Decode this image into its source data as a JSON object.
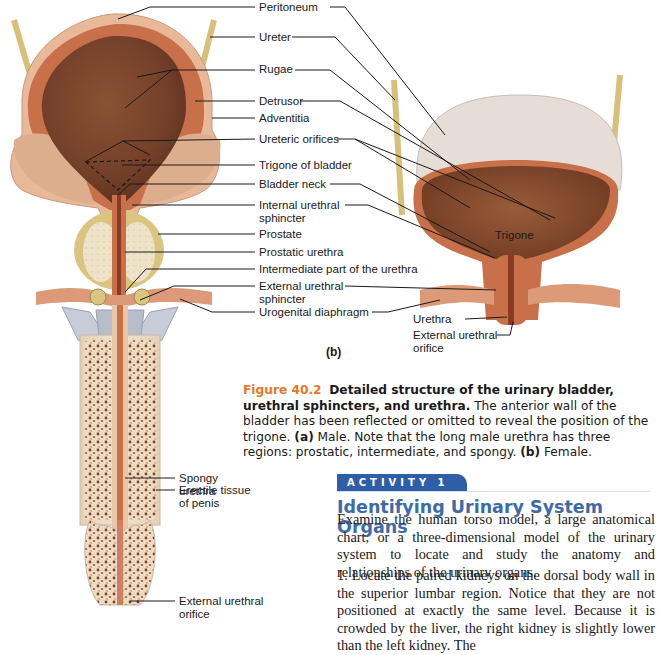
{
  "figure": {
    "panel_a_labels": {
      "peritoneum": "Peritoneum",
      "ureter": "Ureter",
      "rugae": "Rugae",
      "detrusor": "Detrusor",
      "adventitia": "Adventitia",
      "ureteric_orifices": "Ureteric orifices",
      "trigone_of_bladder": "Trigone of bladder",
      "bladder_neck": "Bladder neck",
      "internal_urethral_sphincter": "Internal urethral sphincter",
      "prostate": "Prostate",
      "prostatic_urethra": "Prostatic urethra",
      "intermediate_urethra": "Intermediate part of the urethra",
      "external_urethral_sphincter": "External urethral sphincter",
      "urogenital_diaphragm": "Urogenital diaphragm",
      "spongy_urethra": "Spongy urethra",
      "erectile_tissue": "Erectile tissue of penis",
      "external_urethral_orifice": "External urethral orifice"
    },
    "panel_b_labels": {
      "trigone": "Trigone",
      "urethra": "Urethra",
      "external_urethral_orifice": "External urethral orifice"
    },
    "panel_b_letter": "(b)",
    "colors": {
      "bladder_interior": "#7a4328",
      "bladder_wall": "#c8704a",
      "peritoneum": "#e8c6a8",
      "ureter": "#d8c07a",
      "prostate": "#d9c480",
      "erectile_tissue": "#ead8c0",
      "leader_line": "#1a1a1a"
    }
  },
  "caption": {
    "figure_number": "Figure 40.2",
    "title": "Detailed structure of the urinary bladder, urethral sphincters, and urethra.",
    "text1": " The anterior wall of the bladder has been reflected or omitted to reveal the position of the trigone. ",
    "a_label": "(a)",
    "text2": " Male. Note that the long male urethra has three regions: prostatic, intermediate, and spongy. ",
    "b_label": "(b)",
    "text3": " Female.",
    "figure_color": "#e37a2a"
  },
  "activity": {
    "badge": "ACTIVITY 1",
    "badge_color": "#2f5ea8",
    "title": "Identifying Urinary System Organs",
    "title_color": "#3e6aa8",
    "intro": "Examine the human torso model, a large anatomical chart, or a three-dimensional model of the urinary system to locate and study the anatomy and relationships of the urinary organs.",
    "step1": "1.  Locate the paired kidneys on the dorsal body wall in the superior lumbar region. Notice that they are not positioned at exactly the same level. Because it is crowded by the liver, the right kidney is slightly lower than the left kidney. The"
  }
}
